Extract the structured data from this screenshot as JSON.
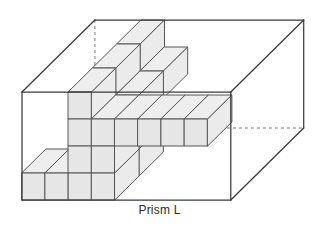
{
  "figure": {
    "caption": "Prism L",
    "type": "isometric-solid-figure",
    "colors": {
      "outline": "#3a3a3a",
      "hidden_edge": "#777777",
      "cube_outline": "#555555",
      "face_top": "#eeeeee",
      "face_front": "#e6e6e6",
      "face_side": "#ebebeb",
      "background": "#ffffff",
      "caption_color": "#2b2b2b"
    },
    "projection": {
      "origin_x": 22,
      "origin_y": 200,
      "unit_x": 23.2,
      "unit_y": 27.0,
      "depth_x": 24.3,
      "depth_y": -24.0
    },
    "prism": {
      "width_units": 9,
      "height_units": 4,
      "depth_units": 3
    },
    "cubes": [
      [
        0,
        0,
        0
      ],
      [
        1,
        0,
        0
      ],
      [
        2,
        0,
        0
      ],
      [
        3,
        0,
        0
      ],
      [
        2,
        1,
        0
      ],
      [
        3,
        1,
        0
      ],
      [
        2,
        2,
        0
      ],
      [
        3,
        2,
        0
      ],
      [
        4,
        2,
        0
      ],
      [
        5,
        2,
        0
      ],
      [
        6,
        2,
        0
      ],
      [
        7,
        2,
        0
      ],
      [
        2,
        3,
        0
      ],
      [
        2,
        0,
        1
      ],
      [
        3,
        0,
        1
      ],
      [
        2,
        1,
        1
      ],
      [
        3,
        1,
        1
      ],
      [
        2,
        2,
        1
      ],
      [
        3,
        2,
        1
      ],
      [
        2,
        3,
        1
      ],
      [
        2,
        2,
        2
      ],
      [
        3,
        2,
        2
      ],
      [
        2,
        3,
        2
      ]
    ]
  }
}
